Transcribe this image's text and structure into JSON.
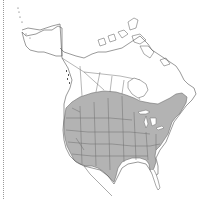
{
  "map": {
    "subject": "North America range map",
    "colors": {
      "background": "#ffffff",
      "outline": "#555555",
      "range_fill": "#b3b3b3",
      "border_line": "#6e6e6e"
    },
    "legend": []
  }
}
